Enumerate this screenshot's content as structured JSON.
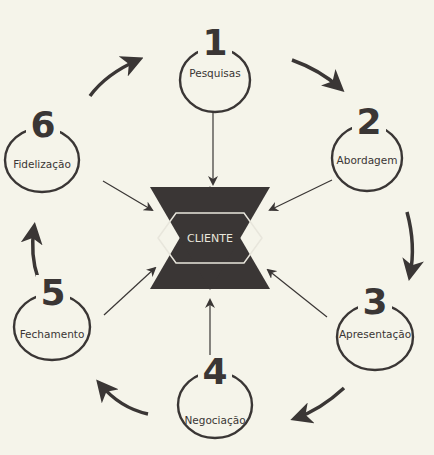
{
  "diagram": {
    "center": {
      "label": "CLIENTE",
      "shape": "six-pointed-star"
    },
    "steps": [
      {
        "number": "1",
        "label": "Pesquisas"
      },
      {
        "number": "2",
        "label": "Abordagem"
      },
      {
        "number": "3",
        "label": "Apresentação"
      },
      {
        "number": "4",
        "label": "Negociação"
      },
      {
        "number": "5",
        "label": "Fechamento"
      },
      {
        "number": "6",
        "label": "Fidelização"
      }
    ],
    "flow": "1 → 2 → 3 → 4 → 5 → 6 → 1; every step points to CLIENTE",
    "colors": {
      "background": "#f5f4ea",
      "ink": "#3a3635",
      "star": "#3a3635",
      "star_text": "#e8e6dc"
    }
  }
}
